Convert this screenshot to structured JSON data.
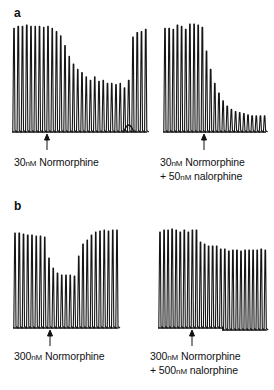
{
  "panels": {
    "a": {
      "letter": "a",
      "left": {
        "caption_line1": "30nM Normorphine",
        "caption_conc": "30",
        "caption_unit": "nM",
        "caption_drug": "Normorphine"
      },
      "right": {
        "caption_line1_conc": "30",
        "caption_line1_unit": "nM",
        "caption_line1_drug": "Normorphine",
        "caption_line2_prefix": "+ 50",
        "caption_line2_unit": "nM",
        "caption_line2_drug": "nalorphine"
      }
    },
    "b": {
      "letter": "b",
      "left": {
        "caption_conc": "300",
        "caption_unit": "nM",
        "caption_drug": "Normorphine"
      },
      "right": {
        "caption_line1_conc": "300",
        "caption_line1_unit": "nM",
        "caption_line1_drug": "Normorphine",
        "caption_line2_prefix": "+ 500",
        "caption_line2_unit": "nM",
        "caption_line2_drug": "nalorphine"
      }
    }
  },
  "chart_data": [
    {
      "type": "line",
      "title": "a (left): 30 nM Normorphine",
      "description": "Twitch contraction trace; relative spike amplitude (1.0 = control)",
      "x0": 14,
      "dx": 4.25,
      "baseline_y": 132,
      "full_height": 108,
      "drug_added_index": 8,
      "values": [
        0.96,
        0.98,
        0.98,
        0.99,
        0.98,
        0.98,
        0.98,
        0.97,
        0.98,
        0.96,
        0.93,
        0.89,
        0.8,
        0.7,
        0.63,
        0.58,
        0.55,
        0.51,
        0.48,
        0.51,
        0.47,
        0.48,
        0.45,
        0.45,
        0.44,
        0.45,
        0.41,
        0.48,
        0.88,
        0.92,
        0.93,
        0.95
      ]
    },
    {
      "type": "line",
      "title": "a (right): 30 nM Normorphine + 50 nM nalorphine",
      "x0": 165,
      "dx": 4.15,
      "baseline_y": 132,
      "full_height": 108,
      "drug_added_index": 9,
      "values": [
        0.96,
        0.96,
        0.95,
        0.99,
        0.98,
        0.95,
        1.0,
        1.0,
        0.99,
        0.97,
        0.75,
        0.58,
        0.45,
        0.36,
        0.29,
        0.24,
        0.21,
        0.19,
        0.18,
        0.17,
        0.16,
        0.15,
        0.15,
        0.15,
        0.15
      ]
    },
    {
      "type": "line",
      "title": "b (left): 300 nM Normorphine",
      "x0": 15,
      "dx": 4.25,
      "baseline_y": 328,
      "full_height": 100,
      "drug_added_index": 8,
      "values": [
        0.95,
        0.95,
        0.94,
        0.93,
        0.93,
        0.92,
        0.92,
        0.91,
        0.7,
        0.6,
        0.55,
        0.53,
        0.53,
        0.53,
        0.52,
        0.72,
        0.84,
        0.88,
        0.93,
        0.96,
        0.97,
        0.98,
        0.97,
        0.98,
        0.98
      ]
    },
    {
      "type": "line",
      "title": "b (right): 300 nM Normorphine + 500 nM nalorphine",
      "x0": 160,
      "dx": 4.05,
      "baseline_y": 328,
      "full_height": 100,
      "drug_added_index": 9,
      "baseline_step_index": 16,
      "baseline_step": 2,
      "values": [
        0.96,
        0.98,
        0.98,
        0.99,
        0.98,
        0.96,
        0.98,
        0.96,
        0.98,
        0.98,
        0.86,
        0.84,
        0.82,
        0.82,
        0.82,
        0.79,
        0.81,
        0.79,
        0.8,
        0.8,
        0.79,
        0.8,
        0.8,
        0.8,
        0.8,
        0.81,
        0.8
      ]
    }
  ]
}
